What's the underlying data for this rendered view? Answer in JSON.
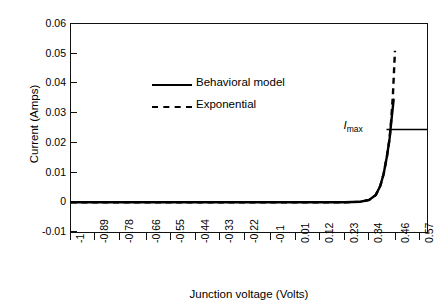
{
  "chart_data": {
    "type": "line",
    "title": "",
    "xlabel": "Junction voltage  (Volts)",
    "ylabel": "Current (Amps)",
    "xlim": [
      -1.0,
      0.6
    ],
    "ylim": [
      -0.01,
      0.06
    ],
    "grid": false,
    "legend_position": "upper-center-left",
    "xtick_labels": [
      "-1",
      "-0.89",
      "-0.78",
      "-0.66",
      "-0.55",
      "-0.44",
      "-0.33",
      "-0.22",
      "-0.1",
      "0.01",
      "0.12",
      "0.23",
      "0.34",
      "0.46",
      "0.57"
    ],
    "xtick_values": [
      -1,
      -0.89,
      -0.78,
      -0.66,
      -0.55,
      -0.44,
      -0.33,
      -0.22,
      -0.1,
      0.01,
      0.12,
      0.23,
      0.34,
      0.46,
      0.57
    ],
    "ytick_labels": [
      "0.06",
      "0.05",
      "0.04",
      "0.03",
      "0.02",
      "0.01",
      "0",
      "-0.01"
    ],
    "ytick_values": [
      0.06,
      0.05,
      0.04,
      0.03,
      0.02,
      0.01,
      0.0,
      -0.01
    ],
    "annotations": [
      {
        "text": "Imax",
        "text_main": "I",
        "text_sub": "max",
        "x": 0.4,
        "y": 0.0245,
        "note": "horizontal line from curve to right axis at I = 0.0245 A"
      }
    ],
    "series": [
      {
        "name": "Behavioral model",
        "style": "solid",
        "color": "#000000",
        "x": [
          -1.0,
          -0.89,
          -0.78,
          -0.66,
          -0.55,
          -0.44,
          -0.33,
          -0.22,
          -0.1,
          0.01,
          0.12,
          0.23,
          0.3,
          0.34,
          0.37,
          0.39,
          0.405,
          0.42,
          0.432,
          0.44,
          0.45
        ],
        "y": [
          0.0,
          0.0,
          0.0,
          0.0,
          0.0,
          0.0,
          0.0,
          0.0,
          0.0,
          0.0,
          0.0,
          0.0,
          0.0002,
          0.0008,
          0.0025,
          0.0055,
          0.0095,
          0.0155,
          0.0215,
          0.0275,
          0.0345
        ]
      },
      {
        "name": "Exponential",
        "style": "dashed",
        "color": "#000000",
        "x": [
          -1.0,
          -0.89,
          -0.78,
          -0.66,
          -0.55,
          -0.44,
          -0.33,
          -0.22,
          -0.1,
          0.01,
          0.12,
          0.23,
          0.3,
          0.34,
          0.37,
          0.39,
          0.405,
          0.42,
          0.432,
          0.44,
          0.447,
          0.452,
          0.456
        ],
        "y": [
          0.0,
          0.0,
          0.0,
          0.0,
          0.0,
          0.0,
          0.0,
          0.0,
          0.0,
          0.0,
          0.0,
          0.0,
          0.0002,
          0.0008,
          0.0025,
          0.0055,
          0.0095,
          0.0155,
          0.0215,
          0.0285,
          0.0365,
          0.0445,
          0.051
        ]
      }
    ],
    "imax_line": {
      "y": 0.0245,
      "x_start": 0.418,
      "x_end": 0.6,
      "style": "solid"
    }
  },
  "caption_artifact": " "
}
